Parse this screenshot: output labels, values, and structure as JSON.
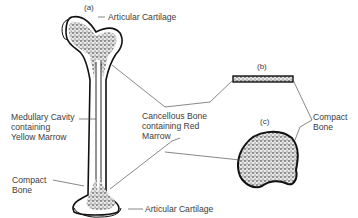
{
  "diagram": {
    "panel_labels": {
      "a": "(a)",
      "b": "(b)",
      "c": "(c)"
    },
    "labels": {
      "articular_cartilage_top": "Articular Cartilage",
      "articular_cartilage_bottom": "Articular Cartilage",
      "medullary_cavity": [
        "Medullary Cavity",
        "containing",
        "Yellow Marrow"
      ],
      "compact_bone_left": [
        "Compact",
        "Bone"
      ],
      "cancellous_bone": [
        "Cancellous Bone",
        "containing Red",
        "Marrow"
      ],
      "compact_bone_right": [
        "Compact",
        "Bone"
      ]
    }
  }
}
